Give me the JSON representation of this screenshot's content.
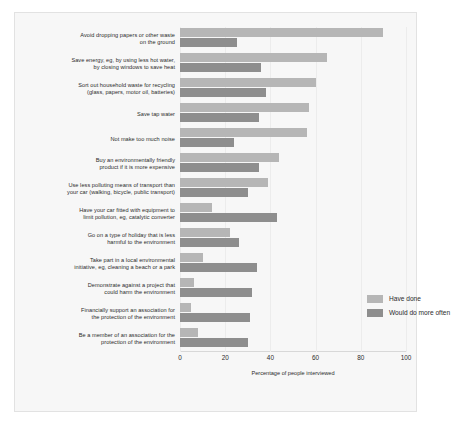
{
  "chart_data": {
    "type": "bar",
    "orientation": "horizontal",
    "title": "",
    "xlabel": "Percentage of people interviewed",
    "ylabel": "",
    "xlim": [
      0,
      100
    ],
    "xticks": [
      0,
      20,
      40,
      60,
      80,
      100
    ],
    "grid": true,
    "legend_position": "inside-right",
    "categories": [
      "Avoid dropping papers or other waste on the ground",
      "Save energy, eg, by using less hot water, by closing windows to save heat",
      "Sort out household waste for recycling (glass, papers, motor oil, batteries)",
      "Save tap water",
      "Not make too much noise",
      "Buy an environmentally friendly product if it is more expensive",
      "Use less polluting means of transport than your car (walking, bicycle, public transport)",
      "Have your car fitted with equipment to limit pollution, eg, catalytic converter",
      "Go on a type of holiday that is less harmful to the environment",
      "Take part in a local environmental initiative, eg, cleaning a beach or a park",
      "Demonstrate against a project that could harm the environment",
      "Financially support an association for the protection of the environment",
      "Be a member of an association for the protection of the environment"
    ],
    "category_lines": [
      [
        "Avoid dropping papers or other waste",
        "on the ground"
      ],
      [
        "Save energy, eg, by using less hot water,",
        "by closing windows to save heat"
      ],
      [
        "Sort out household waste for recycling",
        "(glass, papers, motor oil, batteries)"
      ],
      [
        "Save tap water"
      ],
      [
        "Not make too much noise"
      ],
      [
        "Buy an environmentally friendly",
        "product if it is more expensive"
      ],
      [
        "Use less polluting means of transport than",
        "your car (walking, bicycle, public transport)"
      ],
      [
        "Have your car fitted with equipment to",
        "limit pollution, eg, catalytic converter"
      ],
      [
        "Go on a type of holiday that is less",
        "harmful to the environment"
      ],
      [
        "Take part in a local environmental",
        "initiative, eg, cleaning a beach or a park"
      ],
      [
        "Demonstrate against a project that",
        "could harm the environment"
      ],
      [
        "Financially support an association for",
        "the protection of the environment"
      ],
      [
        "Be a member of an association for the",
        "protection of the environment"
      ]
    ],
    "series": [
      {
        "name": "Have done",
        "color": "#b6b6b6",
        "values": [
          90,
          65,
          60,
          57,
          56,
          44,
          39,
          14,
          22,
          10,
          6,
          5,
          8
        ]
      },
      {
        "name": "Would do more often",
        "color": "#8e8e8e",
        "values": [
          25,
          36,
          38,
          35,
          24,
          35,
          30,
          43,
          26,
          34,
          32,
          31,
          30
        ]
      }
    ]
  },
  "legend": {
    "items": [
      {
        "label": "Have done",
        "swatch": "have"
      },
      {
        "label": "Would do more often",
        "swatch": "would"
      }
    ]
  }
}
